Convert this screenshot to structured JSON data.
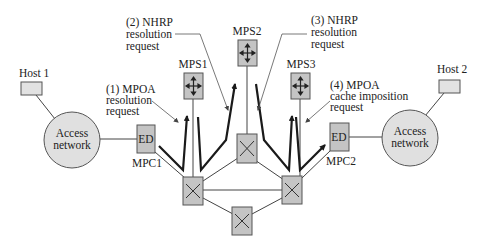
{
  "diagram": {
    "hosts": [
      {
        "id": "host1",
        "label": "Host 1"
      },
      {
        "id": "host2",
        "label": "Host 2"
      }
    ],
    "access_networks": [
      {
        "id": "access-left",
        "line1": "Access",
        "line2": "network"
      },
      {
        "id": "access-right",
        "line1": "Access",
        "line2": "network"
      }
    ],
    "edge_devices": [
      {
        "id": "mpc1",
        "box_label": "ED",
        "name": "MPC1"
      },
      {
        "id": "mpc2",
        "box_label": "ED",
        "name": "MPC2"
      }
    ],
    "servers": [
      {
        "id": "mps1",
        "label": "MPS1"
      },
      {
        "id": "mps2",
        "label": "MPS2"
      },
      {
        "id": "mps3",
        "label": "MPS3"
      }
    ],
    "annotations": [
      {
        "id": "step1",
        "line1": "(1) MPOA",
        "line2": "resolution",
        "line3": "request"
      },
      {
        "id": "step2",
        "line1": "(2) NHRP",
        "line2": "resolution",
        "line3": "request"
      },
      {
        "id": "step3",
        "line1": "(3) NHRP",
        "line2": "resolution",
        "line3": "request"
      },
      {
        "id": "step4",
        "line1": "(4) MPOA",
        "line2": "cache imposition",
        "line3": "request"
      }
    ],
    "switches": [
      {
        "id": "switch-left"
      },
      {
        "id": "switch-center-top"
      },
      {
        "id": "switch-right"
      },
      {
        "id": "switch-bottom"
      }
    ],
    "colors": {
      "box_fill": "#c4c4c4",
      "circle_fill": "#e0e0e0",
      "host_fill": "#e2e2e2",
      "line": "#444444"
    }
  }
}
